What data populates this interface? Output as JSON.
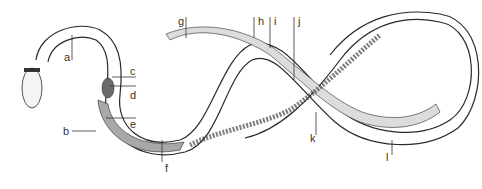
{
  "diagram": {
    "colors": {
      "outline": "#2a2a2a",
      "organ_fill": "#dcdcdc",
      "dark_organ": "#6a6a6a",
      "gut_dark": "#8a8a8a",
      "background": "#ffffff"
    },
    "labels": [
      {
        "id": "a",
        "text": "a",
        "x": 64,
        "y": 55,
        "line": [
          [
            72,
            60
          ],
          [
            72,
            35
          ]
        ]
      },
      {
        "id": "b",
        "text": "b",
        "x": 63,
        "y": 126,
        "line": [
          [
            72,
            131
          ],
          [
            96,
            131
          ]
        ]
      },
      {
        "id": "c",
        "text": "c",
        "x": 128,
        "y": 66,
        "line": [
          [
            112,
            77
          ],
          [
            136,
            77
          ]
        ]
      },
      {
        "id": "d",
        "text": "d",
        "x": 128,
        "y": 90,
        "line": [
          [
            110,
            86
          ],
          [
            136,
            86
          ]
        ]
      },
      {
        "id": "e",
        "text": "e",
        "x": 128,
        "y": 120,
        "line": [
          [
            106,
            118
          ],
          [
            136,
            118
          ]
        ]
      },
      {
        "id": "f",
        "text": "f",
        "x": 165,
        "y": 166,
        "line": [
          [
            162,
            162
          ],
          [
            162,
            140
          ]
        ]
      },
      {
        "id": "g",
        "text": "g",
        "x": 178,
        "y": 15,
        "line": [
          [
            186,
            17
          ],
          [
            186,
            38
          ]
        ]
      },
      {
        "id": "h",
        "text": "h",
        "x": 258,
        "y": 15,
        "line": [
          [
            254,
            17
          ],
          [
            254,
            38
          ]
        ]
      },
      {
        "id": "i",
        "text": "i",
        "x": 274,
        "y": 15,
        "line": [
          [
            270,
            17
          ],
          [
            270,
            48
          ]
        ]
      },
      {
        "id": "j",
        "text": "j",
        "x": 298,
        "y": 15,
        "line": [
          [
            294,
            17
          ],
          [
            294,
            80
          ]
        ]
      },
      {
        "id": "k",
        "text": "k",
        "x": 310,
        "y": 130,
        "line": [
          [
            316,
            135
          ],
          [
            316,
            112
          ]
        ]
      },
      {
        "id": "l",
        "text": "l",
        "x": 386,
        "y": 151,
        "line": [
          [
            392,
            155
          ],
          [
            392,
            140
          ]
        ]
      }
    ]
  }
}
